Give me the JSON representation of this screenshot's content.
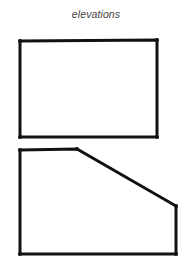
{
  "title": "elevations",
  "colors": {
    "stroke": "#111111",
    "title": "#444444",
    "background": "#ffffff"
  },
  "shapes": [
    {
      "name": "elevation-rectangle",
      "type": "polygon",
      "points": [
        [
          20,
          41
        ],
        [
          157,
          40
        ],
        [
          157,
          137
        ],
        [
          20,
          137
        ]
      ]
    },
    {
      "name": "elevation-sloped-pentagon",
      "type": "polygon",
      "points": [
        [
          20,
          150
        ],
        [
          77,
          149
        ],
        [
          176,
          206
        ],
        [
          176,
          254
        ],
        [
          20,
          254
        ]
      ]
    }
  ]
}
